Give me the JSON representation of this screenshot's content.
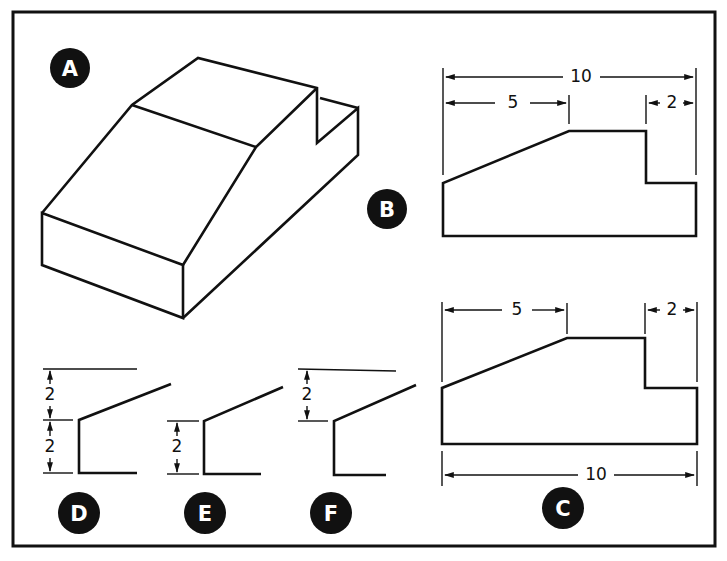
{
  "figure": {
    "views": {
      "A": {
        "label": "A",
        "description": "isometric view of block with sloped top and notch"
      },
      "B": {
        "label": "B",
        "dims": {
          "overall": "10",
          "slope_width": "5",
          "notch_width": "2"
        }
      },
      "C": {
        "label": "C",
        "dims": {
          "overall": "10",
          "slope_width": "5",
          "notch_width": "2"
        }
      },
      "D": {
        "label": "D",
        "dims": {
          "upper": "2",
          "lower": "2"
        }
      },
      "E": {
        "label": "E",
        "dims": {
          "lower": "2"
        }
      },
      "F": {
        "label": "F",
        "dims": {
          "upper": "2"
        }
      }
    },
    "colors": {
      "ink": "#111111",
      "background": "#ffffff"
    }
  }
}
